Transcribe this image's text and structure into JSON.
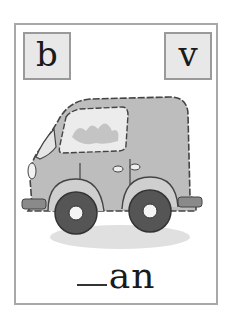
{
  "card": {
    "left_letter": "b",
    "right_letter": "v",
    "word_blank": "__",
    "word_suffix": "an",
    "picture": "van-illustration"
  },
  "colors": {
    "border": "#a8a8a8",
    "letter_box_fill": "#e8e8e8",
    "van_body": "#bdbdbd",
    "wheel": "#555555"
  }
}
